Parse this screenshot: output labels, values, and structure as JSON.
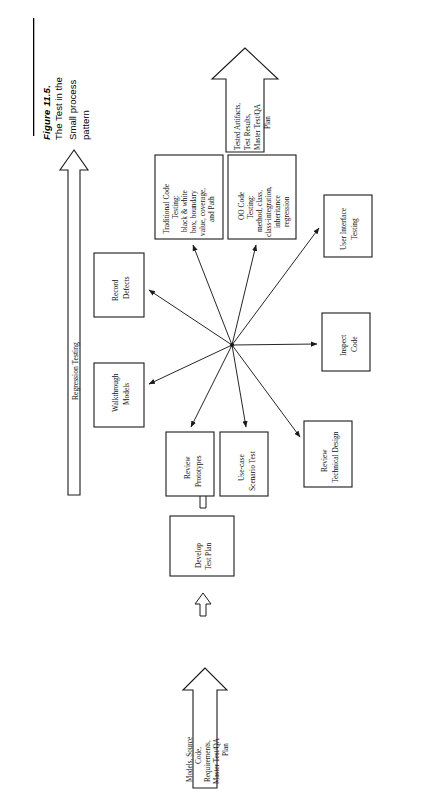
{
  "figure": {
    "number_label": "Figure 11.5.",
    "caption_line1": "The Test in the",
    "caption_line2": "Small process",
    "caption_line3": "pattern"
  },
  "diagram": {
    "orientation": "rotated-90-ccw",
    "input_arrow": {
      "name": "input-arrow",
      "line1": "Models, Source",
      "line2": "Code,",
      "line3": "Requirements,",
      "line4": "Master Test/QA",
      "line5": "Plan"
    },
    "output_arrow": {
      "name": "output-arrow",
      "line1": "Tested Artifacts,",
      "line2": "Test Results,",
      "line3": "Master Test/QA",
      "line4": "Plan"
    },
    "regression_arrow": {
      "name": "regression-testing-arrow",
      "label": "Regression Testing"
    },
    "entry_process": {
      "line1": "Develop",
      "line2": "Test Plan"
    },
    "activities": [
      {
        "id": "traditional-code-testing",
        "lines": [
          "Traditional Code",
          "Testing:",
          "black & white",
          "box, boundary",
          "value, coverage,",
          "and Path"
        ]
      },
      {
        "id": "oo-code-testing",
        "lines": [
          "OO Code",
          "Testing:",
          "method, class,",
          "class-integration,",
          "inheritance",
          "regression"
        ]
      },
      {
        "id": "user-interface-testing",
        "lines": [
          "User Interface",
          "Testing"
        ]
      },
      {
        "id": "inspect-code",
        "lines": [
          "Inspect",
          "Code"
        ]
      },
      {
        "id": "review-technical-design",
        "lines": [
          "Review",
          "Technical Design"
        ]
      },
      {
        "id": "use-case-scenario-test",
        "lines": [
          "Use-case",
          "Scenario Test"
        ]
      },
      {
        "id": "review-prototypes",
        "lines": [
          "Review",
          "Prototypes"
        ]
      },
      {
        "id": "walkthrough-models",
        "lines": [
          "Walkthrough",
          "Models"
        ]
      },
      {
        "id": "record-defects",
        "lines": [
          "Record",
          "Defects"
        ]
      }
    ],
    "colors": {
      "stroke": "#1a1a1a",
      "fill": "#ffffff",
      "text": "#111111"
    }
  }
}
